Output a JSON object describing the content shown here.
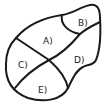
{
  "diagram": {
    "type": "region-map",
    "stroke_color": "#1a1a1a",
    "background": "#ffffff",
    "regions": [
      {
        "id": "A",
        "label": "A)"
      },
      {
        "id": "B",
        "label": "B)"
      },
      {
        "id": "C",
        "label": "C)"
      },
      {
        "id": "D",
        "label": "D)"
      },
      {
        "id": "E",
        "label": "E)"
      }
    ]
  }
}
